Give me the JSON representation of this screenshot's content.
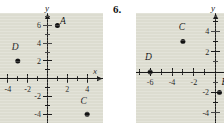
{
  "page": {
    "background_color": "#ffffff",
    "plot_background_color": "#dcdcd0",
    "ink_color": "#1b1b1b"
  },
  "problems": [
    {
      "number_label": "",
      "chart_data": {
        "type": "scatter",
        "title": "",
        "xlabel": "x",
        "ylabel": "y",
        "grid": false,
        "legend": "none",
        "xlim": [
          -5.6,
          5.6
        ],
        "ylim": [
          -5.0,
          7.4
        ],
        "xticks": [
          -4,
          -2,
          2,
          4
        ],
        "xtick_labels": [
          "-4",
          "-2",
          "2",
          "4"
        ],
        "yticks": [
          -4,
          -2,
          2,
          4,
          6
        ],
        "ytick_labels": [
          "-4",
          "-2",
          "2",
          "4",
          "6"
        ],
        "xtick_minor": [
          -5,
          -3,
          -1,
          1,
          3,
          5
        ],
        "ytick_minor": [
          -3,
          -1,
          1,
          3,
          5,
          7
        ],
        "points": [
          {
            "label": "A",
            "x": 1,
            "y": 6,
            "label_dx": 0.55,
            "label_dy": 0.15
          },
          {
            "label": "C",
            "x": 4,
            "y": -4,
            "label_dx": -0.35,
            "label_dy": 1.15
          },
          {
            "label": "D",
            "x": -3,
            "y": 2,
            "label_dx": -0.25,
            "label_dy": 1.2
          }
        ]
      }
    },
    {
      "number_label": "6.",
      "chart_data": {
        "type": "scatter",
        "title": "",
        "xlabel": "x",
        "ylabel": "y",
        "grid": false,
        "legend": "none",
        "xlim": [
          -7.3,
          1.5
        ],
        "ylim": [
          -5.0,
          5.8
        ],
        "xticks": [
          -6,
          -4,
          -2
        ],
        "xtick_labels": [
          "-6",
          "-4",
          "-2"
        ],
        "yticks": [
          -4,
          -2,
          2,
          4
        ],
        "ytick_labels": [
          "-4",
          "-2",
          "2",
          "4"
        ],
        "xtick_minor": [
          -7,
          -5,
          -3,
          -1
        ],
        "ytick_minor": [
          -3,
          -1,
          1,
          3,
          5
        ],
        "points": [
          {
            "label": "C",
            "x": -3,
            "y": 3,
            "label_dx": -0.1,
            "label_dy": 1.1
          },
          {
            "label": "D",
            "x": -6,
            "y": 0,
            "label_dx": -0.15,
            "label_dy": 1.15
          },
          {
            "label": "B",
            "x": 0.35,
            "y": -2,
            "label_dx": 0.45,
            "label_dy": 0.75
          }
        ]
      }
    }
  ]
}
